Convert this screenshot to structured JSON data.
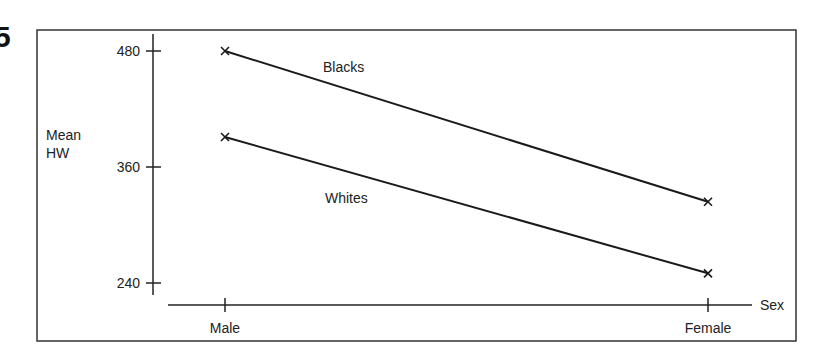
{
  "figure": {
    "number_fragment": "5"
  },
  "chart_data": {
    "type": "line",
    "title": "",
    "xlabel": "Sex",
    "ylabel": "Mean HW",
    "ylabel_lines": [
      "Mean",
      "HW"
    ],
    "categories": [
      "Male",
      "Female"
    ],
    "series": [
      {
        "name": "Blacks",
        "values": [
          480,
          324
        ]
      },
      {
        "name": "Whites",
        "values": [
          391,
          250
        ]
      }
    ],
    "yticks": [
      240,
      360,
      480
    ],
    "ytick_labels": [
      "240",
      "360",
      "480"
    ],
    "ylim": [
      225,
      497
    ],
    "grid": false,
    "legend": "inline labels on lines",
    "marker": "x"
  }
}
